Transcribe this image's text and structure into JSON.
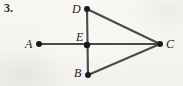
{
  "figure": {
    "item_number": "3.",
    "background_color": "#f7f6f3",
    "stroke_color": "#4a4a4a",
    "point_color": "#1a1a1a",
    "label_color": "#232323",
    "width": 183,
    "height": 86,
    "points": [
      {
        "id": "A",
        "label": "A",
        "x": 39,
        "y": 44
      },
      {
        "id": "B",
        "label": "B",
        "x": 88,
        "y": 75
      },
      {
        "id": "C",
        "label": "C",
        "x": 160,
        "y": 44
      },
      {
        "id": "D",
        "label": "D",
        "x": 87,
        "y": 9
      },
      {
        "id": "E",
        "label": "E",
        "x": 87,
        "y": 45
      }
    ],
    "segments": [
      {
        "id": "AC",
        "from": "A",
        "to": "C",
        "x1": 39,
        "y1": 44,
        "x2": 160,
        "y2": 44
      },
      {
        "id": "DB",
        "from": "D",
        "to": "B",
        "x1": 87,
        "y1": 9,
        "x2": 88,
        "y2": 75
      },
      {
        "id": "DC",
        "from": "D",
        "to": "C",
        "x1": 87,
        "y1": 9,
        "x2": 160,
        "y2": 44
      },
      {
        "id": "BC",
        "from": "B",
        "to": "C",
        "x1": 88,
        "y1": 75,
        "x2": 160,
        "y2": 44
      }
    ]
  }
}
